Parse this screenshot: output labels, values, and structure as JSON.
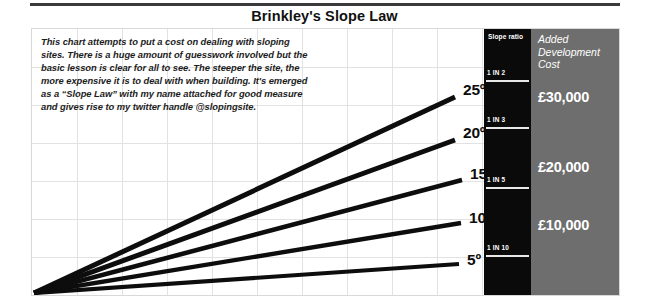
{
  "title": "Brinkley's Slope Law",
  "description": "This chart attempts to put a cost on dealing with sloping sites. There is a huge amount of guesswork involved but the basic lesson is clear for all to see. The steeper the site, the more expensive it is to deal with when building. It's emerged as a “Slope Law” with my name attached for good measure and gives rise to my twitter handle @slopingsite.",
  "slope_ratio_column": {
    "heading": "Slope ratio",
    "items": [
      {
        "label": "1 IN 2"
      },
      {
        "label": "1 IN 3"
      },
      {
        "label": "1 IN 5"
      },
      {
        "label": "1 IN 10"
      }
    ]
  },
  "cost_column": {
    "heading": "Added Development Cost",
    "values": [
      {
        "label": "£30,000"
      },
      {
        "label": "£20,000"
      },
      {
        "label": "£10,000"
      }
    ]
  },
  "angles": [
    {
      "label": "25º"
    },
    {
      "label": "20º"
    },
    {
      "label": "15º"
    },
    {
      "label": "10º"
    },
    {
      "label": "5º"
    }
  ],
  "colors": {
    "ray": "#0d0d0d",
    "slope_ratio_bg": "#0a0a0a",
    "cost_bg": "#6e6e6e",
    "grid": "#e2e2e2",
    "rule": "#3a3a3a",
    "text": "#111111",
    "inverse_text": "#ffffff"
  },
  "chart_data": {
    "type": "line",
    "title": "Brinkley's Slope Law",
    "xlabel": "",
    "ylabel": "",
    "grid": true,
    "legend_position": "none",
    "annotations": [
      "This chart attempts to put a cost on dealing with sloping sites. There is a huge amount of guesswork involved but the basic lesson is clear for all to see. The steeper the site, the more expensive it is to deal with when building. It's emerged as a “Slope Law” with my name attached for good measure and gives rise to my twitter handle @slopingsite."
    ],
    "series": [
      {
        "name": "25º",
        "slope_angle_deg": 25,
        "slope_ratio": "1 IN 2",
        "added_development_cost": 30000,
        "x": [
          0,
          421
        ],
        "y": [
          0,
          196
        ]
      },
      {
        "name": "20º",
        "slope_angle_deg": 20,
        "slope_ratio": "1 IN 3",
        "added_development_cost": 22000,
        "x": [
          0,
          421
        ],
        "y": [
          0,
          153
        ]
      },
      {
        "name": "15º",
        "slope_angle_deg": 15,
        "slope_ratio": "1 IN 5",
        "added_development_cost": 14000,
        "x": [
          0,
          428
        ],
        "y": [
          0,
          113
        ]
      },
      {
        "name": "10º",
        "slope_angle_deg": 10,
        "slope_ratio": "1 IN 10",
        "added_development_cost": 7000,
        "x": [
          0,
          427
        ],
        "y": [
          0,
          70
        ]
      },
      {
        "name": "5º",
        "slope_angle_deg": 5,
        "slope_ratio": "",
        "added_development_cost": 2000,
        "x": [
          0,
          425
        ],
        "y": [
          0,
          29
        ]
      }
    ],
    "right_axis_slope_ratio": {
      "ticks": [
        "1 IN 2",
        "1 IN 3",
        "1 IN 5",
        "1 IN 10"
      ],
      "tick_positions_px_from_top": [
        40,
        87,
        147,
        215
      ]
    },
    "right_axis_cost": {
      "ticks": [
        "£30,000",
        "£20,000",
        "£10,000"
      ],
      "tick_positions_px_from_top": [
        60,
        130,
        188
      ]
    }
  }
}
